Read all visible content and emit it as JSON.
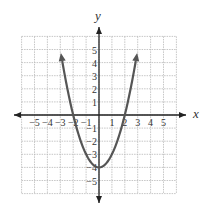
{
  "chart_data": {
    "type": "line",
    "title": "",
    "function": "y = x^2 - 4",
    "xlabel": "x",
    "ylabel": "y",
    "xlim": [
      -6,
      6
    ],
    "ylim": [
      -6,
      6
    ],
    "grid": true,
    "x_tick_labels": [
      "-5",
      "-4",
      "-3",
      "-2",
      "-1",
      "1",
      "2",
      "3",
      "4",
      "5"
    ],
    "y_tick_labels": [
      "5",
      "4",
      "3",
      "2",
      "1",
      "-1",
      "-2",
      "-3",
      "-4",
      "-5"
    ],
    "series": [
      {
        "name": "parabola",
        "x": [
          -3,
          -2.5,
          -2,
          -1.5,
          -1,
          -0.5,
          0,
          0.5,
          1,
          1.5,
          2,
          2.5,
          3
        ],
        "values": [
          5,
          2.25,
          0,
          -1.75,
          -3,
          -3.75,
          -4,
          -3.75,
          -3,
          -1.75,
          0,
          2.25,
          5
        ]
      }
    ],
    "annotations": [
      "x-intercepts at -2 and 2",
      "vertex at (0, -4)",
      "arrows at both ends of curve"
    ]
  },
  "axes": {
    "x_label": "x",
    "y_label": "y"
  },
  "colors": {
    "curve": "#555555",
    "axis": "#222222",
    "grid": "#b8b8b8"
  }
}
